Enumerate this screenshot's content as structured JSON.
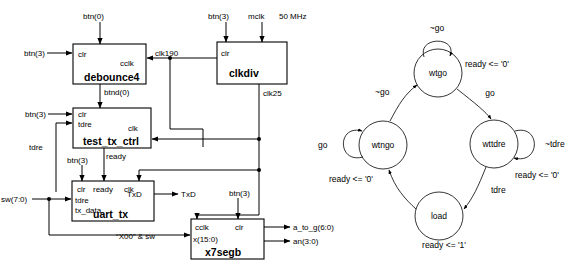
{
  "diagram": {
    "blocks": [
      {
        "id": "debounce4",
        "name": "debounce4",
        "inputs": [
          "clr"
        ],
        "outputs": [
          "cclk",
          "btnd(0)"
        ]
      },
      {
        "id": "clkdiv",
        "name": "clkdiv",
        "inputs": [
          "clr"
        ],
        "outputs": [
          "clk190",
          "clk25"
        ]
      },
      {
        "id": "test_tx_ctrl",
        "name": "test_tx_ctrl",
        "inputs": [
          "clr",
          "tdre",
          "clk"
        ],
        "outputs": [
          "ready"
        ]
      },
      {
        "id": "uart_tx",
        "name": "uart_tx",
        "inputs": [
          "clr",
          "ready",
          "clk",
          "tdre",
          "tx_data"
        ],
        "outputs": [
          "TxD"
        ]
      },
      {
        "id": "x7segb",
        "name": "x7segb",
        "inputs": [
          "cclk",
          "clr",
          "x(15:0)"
        ],
        "outputs": [
          "a_to_g(6:0)",
          "an(3:0)"
        ]
      }
    ],
    "pin_labels": {
      "clr": "clr",
      "cclk": "cclk",
      "btnd0": "btnd(0)",
      "tdre": "tdre",
      "clk": "clk",
      "ready": "ready",
      "tx_data": "tx_data",
      "txd": "TxD",
      "x15_0": "x(15:0)"
    },
    "signals": {
      "btn0": "btn(0)",
      "btn3": "btn(3)",
      "mclk": "mclk",
      "freq": "50 MHz",
      "clk190": "clk190",
      "clk25": "clk25",
      "sw": "sw(7:0)",
      "txd_out": "TxD",
      "a_to_g": "a_to_g(6:0)",
      "an": "an(3:0)",
      "concat": "“X00” & sw"
    }
  },
  "state_machine": {
    "states": [
      {
        "id": "wtgo",
        "label": "wtgo",
        "output": "ready <= '0'"
      },
      {
        "id": "wtngo",
        "label": "wtngo",
        "output": "ready <= '0'"
      },
      {
        "id": "wttdre",
        "label": "wttdre",
        "output": "ready <= '0'"
      },
      {
        "id": "load",
        "label": "load",
        "output": "ready <= '1'"
      }
    ],
    "transitions": [
      {
        "from": "wtgo",
        "to": "wtgo",
        "label": "~go",
        "type": "self"
      },
      {
        "from": "wtgo",
        "to": "wttdre",
        "label": "go"
      },
      {
        "from": "wttdre",
        "to": "wttdre",
        "label": "~tdre",
        "type": "self"
      },
      {
        "from": "wttdre",
        "to": "load",
        "label": "tdre"
      },
      {
        "from": "load",
        "to": "wtngo",
        "label": ""
      },
      {
        "from": "wtngo",
        "to": "wtngo",
        "label": "go",
        "type": "self"
      },
      {
        "from": "wtngo",
        "to": "wtgo",
        "label": "~go"
      }
    ]
  }
}
